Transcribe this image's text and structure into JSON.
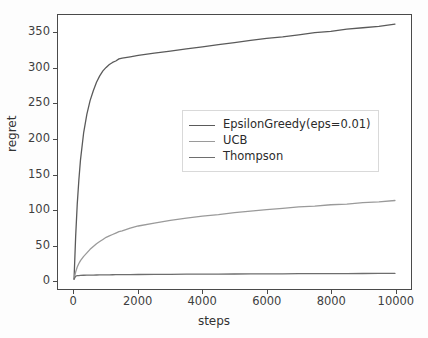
{
  "chart_data": {
    "type": "line",
    "title": "",
    "xlabel": "steps",
    "ylabel": "regret",
    "xlim": [
      -500,
      10500
    ],
    "ylim": [
      -12,
      375
    ],
    "grid": false,
    "legend_position": "center right",
    "xticks": [
      "0",
      "2000",
      "4000",
      "6000",
      "8000",
      "10000"
    ],
    "xtick_values": [
      0,
      2000,
      4000,
      6000,
      8000,
      10000
    ],
    "yticks": [
      "0",
      "50",
      "100",
      "150",
      "200",
      "250",
      "300",
      "350"
    ],
    "ytick_values": [
      0,
      50,
      100,
      150,
      200,
      250,
      300,
      350
    ],
    "x": [
      0,
      50,
      100,
      150,
      200,
      300,
      400,
      500,
      600,
      700,
      800,
      900,
      1000,
      1100,
      1200,
      1300,
      1400,
      1500,
      1750,
      2000,
      2500,
      3000,
      3500,
      4000,
      4500,
      5000,
      5500,
      6000,
      6500,
      7000,
      7500,
      8000,
      8500,
      9000,
      9500,
      10000
    ],
    "series": [
      {
        "name": "EpsilonGreedy(eps=0.01)",
        "color": "#5a5a5a",
        "values": [
          2,
          62,
          108,
          142,
          170,
          209,
          235,
          254,
          268,
          280,
          289,
          296,
          301,
          305,
          308,
          310,
          313,
          314,
          316,
          318,
          321,
          324,
          327,
          330,
          333,
          336,
          339,
          342,
          344,
          347,
          350,
          352,
          355,
          357,
          359,
          362
        ]
      },
      {
        "name": "UCB",
        "color": "#9a9a9a",
        "values": [
          2,
          12,
          19,
          24,
          28,
          34,
          39,
          44,
          48,
          52,
          55,
          58,
          61,
          63,
          65,
          67,
          69,
          70,
          74,
          77,
          81,
          85,
          88,
          91,
          93,
          96,
          98,
          100,
          102,
          104,
          105,
          107,
          108,
          110,
          111,
          113
        ]
      },
      {
        "name": "Thompson",
        "color": "#6e6e6e",
        "values": [
          2,
          6,
          7,
          7,
          7.2,
          7.4,
          7.5,
          7.6,
          7.7,
          7.8,
          7.9,
          8,
          8.05,
          8.1,
          8.15,
          8.2,
          8.25,
          8.3,
          8.4,
          8.5,
          8.65,
          8.8,
          8.9,
          9,
          9.1,
          9.2,
          9.3,
          9.4,
          9.5,
          9.6,
          9.7,
          9.8,
          9.85,
          9.9,
          9.95,
          10
        ]
      }
    ]
  },
  "legend": {
    "entries": [
      {
        "label": "EpsilonGreedy(eps=0.01)"
      },
      {
        "label": "UCB"
      },
      {
        "label": "Thompson"
      }
    ]
  }
}
